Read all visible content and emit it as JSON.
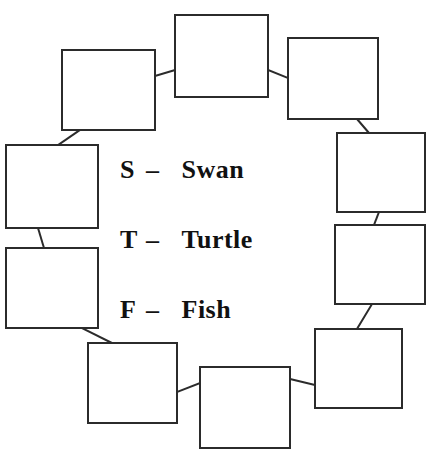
{
  "page": {
    "background_color": "#ffffff",
    "ink_color": "#2b2b2b"
  },
  "legend": {
    "name": "animal-key",
    "entries": [
      {
        "letter": "S",
        "dash": "–",
        "word": "Swan"
      },
      {
        "letter": "T",
        "dash": "–",
        "word": "Turtle"
      },
      {
        "letter": "F",
        "dash": "–",
        "word": "Fish"
      }
    ]
  },
  "diagram": {
    "type": "ring-of-boxes",
    "box_count": 10,
    "box_fill": "#ffffff",
    "box_stroke": "#2b2b2b",
    "box_stroke_width": 2,
    "connector_stroke": "#2b2b2b",
    "connector_stroke_width": 2,
    "boxes": [
      {
        "id": "box-top-center",
        "label": "",
        "x": 175,
        "y": 15,
        "w": 93,
        "h": 82
      },
      {
        "id": "box-top-right",
        "label": "",
        "x": 288,
        "y": 38,
        "w": 90,
        "h": 81
      },
      {
        "id": "box-right-upper",
        "label": "",
        "x": 337,
        "y": 133,
        "w": 88,
        "h": 79
      },
      {
        "id": "box-right-lower",
        "label": "",
        "x": 335,
        "y": 225,
        "w": 90,
        "h": 79
      },
      {
        "id": "box-bottom-right",
        "label": "",
        "x": 315,
        "y": 329,
        "w": 87,
        "h": 79
      },
      {
        "id": "box-bottom-center",
        "label": "",
        "x": 200,
        "y": 367,
        "w": 90,
        "h": 81
      },
      {
        "id": "box-bottom-left",
        "label": "",
        "x": 88,
        "y": 343,
        "w": 89,
        "h": 80
      },
      {
        "id": "box-left-lower",
        "label": "",
        "x": 6,
        "y": 248,
        "w": 92,
        "h": 80
      },
      {
        "id": "box-left-upper",
        "label": "",
        "x": 6,
        "y": 145,
        "w": 92,
        "h": 83
      },
      {
        "id": "box-top-left",
        "label": "",
        "x": 62,
        "y": 50,
        "w": 93,
        "h": 80
      }
    ],
    "connectors": [
      {
        "id": "link-topleft-topcenter",
        "x1": 155,
        "y1": 76,
        "x2": 175,
        "y2": 70
      },
      {
        "id": "link-topcenter-topright",
        "x1": 268,
        "y1": 70,
        "x2": 288,
        "y2": 78
      },
      {
        "id": "link-topright-rightupper",
        "x1": 357,
        "y1": 119,
        "x2": 369,
        "y2": 133
      },
      {
        "id": "link-rightupper-rightlower",
        "x1": 379,
        "y1": 212,
        "x2": 374,
        "y2": 225
      },
      {
        "id": "link-rightlower-bottomright",
        "x1": 372,
        "y1": 304,
        "x2": 357,
        "y2": 329
      },
      {
        "id": "link-bottomright-bottomcenter",
        "x1": 315,
        "y1": 385,
        "x2": 290,
        "y2": 379
      },
      {
        "id": "link-bottomcenter-bottomleft",
        "x1": 200,
        "y1": 383,
        "x2": 177,
        "y2": 392
      },
      {
        "id": "link-bottomleft-leftlower",
        "x1": 112,
        "y1": 343,
        "x2": 82,
        "y2": 328
      },
      {
        "id": "link-leftlower-leftupper",
        "x1": 44,
        "y1": 248,
        "x2": 38,
        "y2": 228
      },
      {
        "id": "link-leftupper-topleft",
        "x1": 58,
        "y1": 145,
        "x2": 80,
        "y2": 130
      }
    ]
  }
}
